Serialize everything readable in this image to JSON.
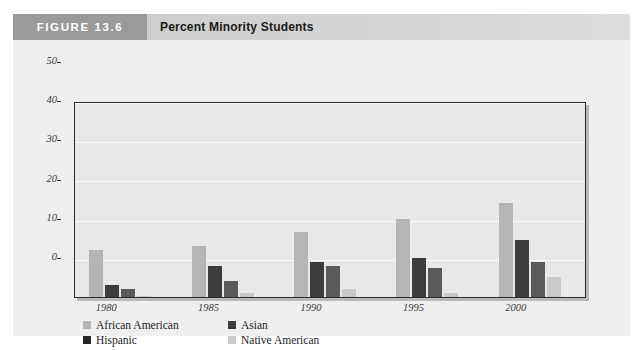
{
  "figure": {
    "number_label": "FIGURE 13.6",
    "title": "Percent Minority Students",
    "source": "Source: Department of Education Enrollment Statistics, 2001"
  },
  "legend": {
    "position": "below-plot",
    "items": [
      {
        "label": "African American",
        "color": "#b5b5b5"
      },
      {
        "label": "Asian",
        "color": "#3d3d3d"
      },
      {
        "label": "Hispanic",
        "color": "#262626"
      },
      {
        "label": "Native American",
        "color": "#c9c9c9"
      }
    ]
  },
  "chart_data": {
    "type": "bar",
    "title": "Percent Minority Students",
    "xlabel": "",
    "ylabel": "",
    "ylim": [
      0,
      50
    ],
    "yticks": [
      0,
      10,
      20,
      30,
      40,
      50
    ],
    "grid": true,
    "categories": [
      "1980",
      "1985",
      "1990",
      "1995",
      "2000"
    ],
    "series": [
      {
        "name": "African American",
        "color": "#b5b5b5",
        "values": [
          12,
          13,
          16.5,
          20,
          24
        ]
      },
      {
        "name": "Asian",
        "color": "#3d3d3d",
        "values": [
          3,
          8,
          9,
          10,
          14.5
        ]
      },
      {
        "name": "Hispanic",
        "color": "#5a5a5a",
        "values": [
          2,
          4,
          8,
          7.5,
          9
        ]
      },
      {
        "name": "Native American",
        "color": "#c9c9c9",
        "values": [
          0.3,
          1,
          2,
          1,
          5
        ]
      }
    ]
  }
}
